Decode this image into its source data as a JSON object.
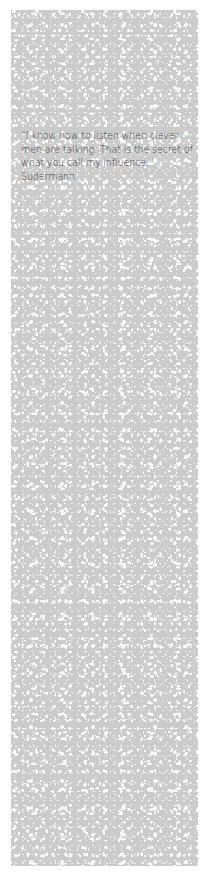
{
  "quote": {
    "text": "“I know how to listen when clever men are talking. That is the secret of what you call my influence.”",
    "author": "Sudermann"
  },
  "colors": {
    "panel_background": "#cbcbcb",
    "speckle": "#ffffff",
    "text": "#3e3e3e",
    "page_background": "#ffffff"
  }
}
